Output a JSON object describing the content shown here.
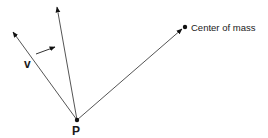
{
  "diagram": {
    "colors": {
      "line": "#555555",
      "arrow_head": "#111111",
      "text": "#1a1a1a",
      "background": "#ffffff"
    },
    "points": {
      "P": {
        "label": "P",
        "x": 77,
        "y": 120
      },
      "center_of_mass": {
        "label": "Center of mass",
        "x": 185,
        "y": 27
      }
    },
    "vectors": [
      {
        "name": "velocity",
        "label": "v",
        "from": [
          77,
          120
        ],
        "to": [
          13,
          32
        ]
      },
      {
        "name": "rotated",
        "label": "",
        "from": [
          77,
          120
        ],
        "to": [
          57,
          7
        ]
      },
      {
        "name": "to-center-of-mass",
        "label": "",
        "from": [
          77,
          120
        ],
        "to": [
          183,
          29
        ]
      }
    ],
    "rotation_indicator": {
      "from": [
        36,
        53
      ],
      "to": [
        55,
        47
      ]
    }
  },
  "labels": {
    "v": "v",
    "P": "P",
    "center_of_mass": "Center of mass"
  }
}
